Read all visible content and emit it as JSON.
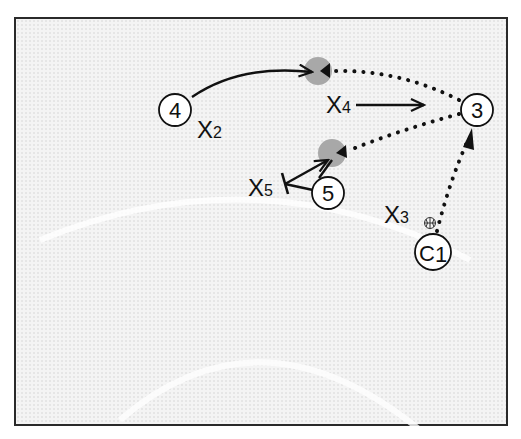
{
  "diagram": {
    "type": "basketball-play",
    "colors": {
      "line": "#111111",
      "ball_spot": "#a8a8a8",
      "court": "#f4f4f4",
      "frame": "#2a2a2a"
    },
    "players": [
      {
        "id": "p4",
        "label": "4"
      },
      {
        "id": "p3",
        "label": "3"
      },
      {
        "id": "p5",
        "label": "5"
      },
      {
        "id": "c1",
        "label": "C",
        "sub": "1"
      }
    ],
    "defenders": [
      {
        "id": "x2",
        "label": "X",
        "sub": "2"
      },
      {
        "id": "x4",
        "label": "X",
        "sub": "4"
      },
      {
        "id": "x5",
        "label": "X",
        "sub": "5"
      },
      {
        "id": "x3",
        "label": "X",
        "sub": "3"
      }
    ],
    "ball_icon": "basketball-icon",
    "paths": [
      {
        "from": "4",
        "to": "ball-spot-top",
        "kind": "cut"
      },
      {
        "from": "3",
        "to": "ball-spot-top",
        "kind": "pass"
      },
      {
        "from": "3",
        "to": "ball-spot-mid",
        "kind": "pass"
      },
      {
        "from": "C1",
        "to": "3",
        "kind": "pass"
      },
      {
        "from": "X4",
        "to": "3",
        "kind": "defender-move"
      },
      {
        "from": "5",
        "to": "ball-spot-mid",
        "kind": "cut"
      },
      {
        "from": "5",
        "to": "X5",
        "kind": "screen"
      }
    ]
  }
}
